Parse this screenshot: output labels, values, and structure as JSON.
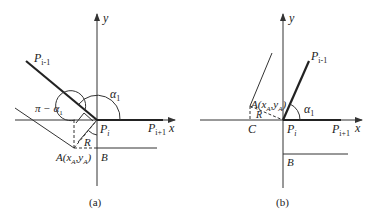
{
  "diagram": {
    "type": "geometry-figure",
    "panels": [
      {
        "id": "a",
        "caption": "(a)",
        "axes": {
          "x_label": "x",
          "y_label": "y"
        },
        "points": {
          "p_prev": "P",
          "p_prev_sub": "i-1",
          "p_cur": "P",
          "p_cur_sub": "i",
          "p_next": "P",
          "p_next_sub": "i+1",
          "a_label": "A(x",
          "a_sub1": "A",
          "a_mid": ",y",
          "a_sub2": "A",
          "a_close": ")",
          "b_label": "B",
          "r_label": "R"
        },
        "angles": {
          "alpha_label": "α",
          "alpha_sub": "1",
          "supplement_label": "π − α",
          "supplement_sub": "1"
        }
      },
      {
        "id": "b",
        "caption": "(b)",
        "axes": {
          "x_label": "x",
          "y_label": "y"
        },
        "points": {
          "p_prev": "P",
          "p_prev_sub": "i-1",
          "p_cur": "P",
          "p_cur_sub": "i",
          "p_next": "P",
          "p_next_sub": "i+1",
          "a_label": "A(x",
          "a_sub1": "A",
          "a_mid": ",y",
          "a_sub2": "A",
          "a_close": ")",
          "b_label": "B",
          "c_label": "C",
          "r_label": "R"
        },
        "angles": {
          "alpha_label": "α",
          "alpha_sub": "1"
        }
      }
    ]
  }
}
